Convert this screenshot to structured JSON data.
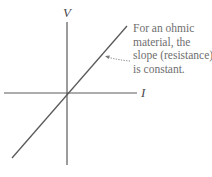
{
  "diagram": {
    "type": "voltage-current graph",
    "axes": {
      "vertical_label": "V",
      "horizontal_label": "I"
    },
    "line": {
      "description": "straight line through origin",
      "color": "#5a5a5a"
    },
    "annotation": {
      "lines": [
        "For an ohmic",
        "material, the",
        "slope (resistance)",
        "is constant."
      ],
      "color": "#6e6e6e"
    },
    "icons": {
      "pointer": "dotted-arrow-icon"
    }
  }
}
